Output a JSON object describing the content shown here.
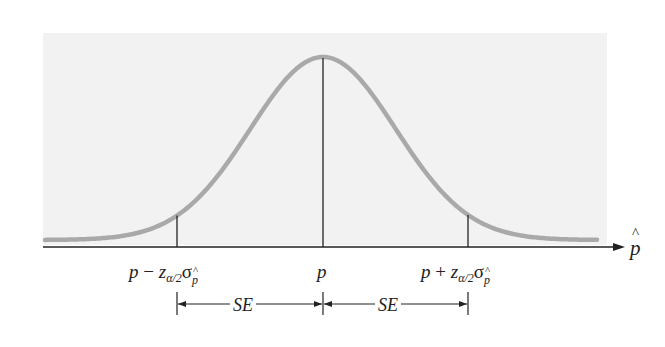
{
  "chart_data": {
    "type": "area",
    "title": "",
    "x_axis_label": "p̂",
    "tick_labels": [
      "p − z_{α/2} σ_{p̂}",
      "p",
      "p + z_{α/2} σ_{p̂}"
    ],
    "tick_positions_sd": [
      -2,
      0,
      2
    ],
    "curve": "normal density",
    "annotations": [
      {
        "label": "SE",
        "from": "p − z_{α/2} σ_{p̂}",
        "to": "p"
      },
      {
        "label": "SE",
        "from": "p",
        "to": "p + z_{α/2} σ_{p̂}"
      }
    ],
    "colors": {
      "curve": "#a9a9a9",
      "panel": "#f2f2f2",
      "axis": "#222222"
    }
  },
  "labels": {
    "axis": "p",
    "center": "p",
    "left_p": "p",
    "left_op": "−",
    "right_p": "p",
    "right_op": "+",
    "z": "z",
    "z_sub": "α/2",
    "sigma": "σ",
    "sigma_sub": "p",
    "se_left": "SE",
    "se_right": "SE"
  }
}
